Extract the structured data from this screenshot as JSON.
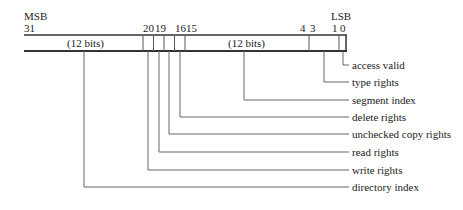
{
  "diagram": {
    "msb_label": "MSB",
    "lsb_label": "LSB",
    "bit_numbers": {
      "b31": "31",
      "b20": "20",
      "b19": "19",
      "b16": "16",
      "b15": "15",
      "b4": "4",
      "b3": "3",
      "b1": "1",
      "b0": "0"
    },
    "fields_in_box": {
      "left_field": "(12 bits)",
      "middle_field": "(12 bits)"
    },
    "field_labels": [
      "access valid",
      "type rights",
      "segment index",
      "delete rights",
      "unchecked copy rights",
      "read rights",
      "write rights",
      "directory index"
    ],
    "line_color": "#333333"
  }
}
